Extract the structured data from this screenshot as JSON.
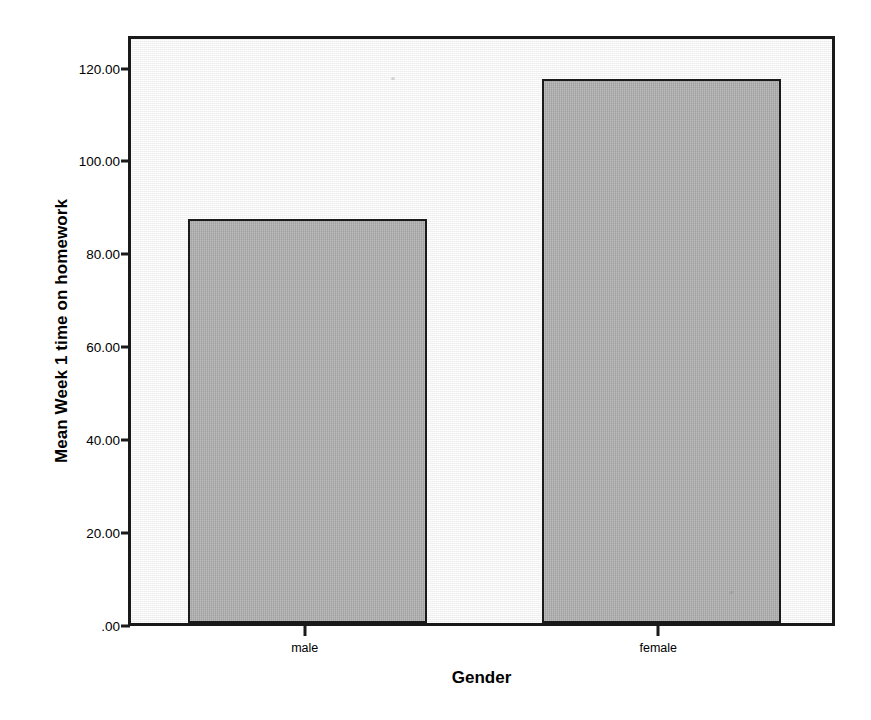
{
  "chart_data": {
    "type": "bar",
    "title": "",
    "xlabel": "Gender",
    "ylabel": "Mean Week 1 time on homework",
    "categories": [
      "male",
      "female"
    ],
    "values": [
      87,
      117
    ],
    "ylim": [
      0,
      127
    ],
    "ytick_values": [
      0,
      20,
      40,
      60,
      80,
      100,
      120
    ],
    "ytick_labels": [
      ".00",
      "20.00",
      "40.00",
      "60.00",
      "80.00",
      "100.00",
      "120.00"
    ],
    "grid": false,
    "legend": "none",
    "bar_fill_color": "#ababab",
    "bar_border_color": "#1a1a1a",
    "plot_background_color": "#f4f4f4",
    "axis_color": "#1a1a1a",
    "page_background_color": "#ffffff"
  }
}
